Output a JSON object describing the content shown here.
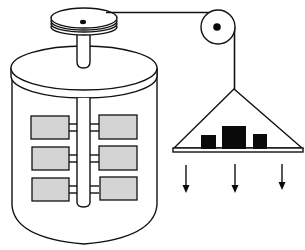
{
  "diagram": {
    "type": "apparatus-illustration",
    "labels": [],
    "components": [
      {
        "id": "drum-pulley",
        "desc": "stacked disc drum on top of vessel shaft"
      },
      {
        "id": "vessel",
        "desc": "cylindrical insulated vessel with lid"
      },
      {
        "id": "shaft",
        "desc": "vertical axle inside vessel"
      },
      {
        "id": "paddles",
        "count": 6,
        "rows": 3,
        "columns": 2,
        "fill": "#d4d4d4"
      },
      {
        "id": "string",
        "desc": "cord from drum over pulley to weight hanger"
      },
      {
        "id": "side-pulley",
        "desc": "fixed pulley with black hub"
      },
      {
        "id": "weight-hanger",
        "desc": "triangular hanger with base plate"
      },
      {
        "id": "weights",
        "count": 3,
        "fill": "#0a0a0a"
      },
      {
        "id": "force-arrows",
        "count": 3,
        "direction": "down"
      }
    ],
    "colors": {
      "line": "#111111",
      "paddle_fill": "#d4d4d4",
      "weight_fill": "#0a0a0a",
      "background": "#ffffff"
    }
  }
}
